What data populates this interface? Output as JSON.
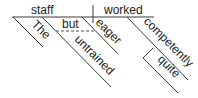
{
  "diagram": {
    "type": "Reed-Kellogg sentence diagram",
    "sentence_words": {
      "subject": "staff",
      "verb": "worked",
      "subject_modifier_article": "The",
      "conjunction": "but",
      "subject_modifier_1": "untrained",
      "subject_modifier_2": "eager",
      "verb_modifier": "competently",
      "adverb_modifier": "quite"
    },
    "colors": {
      "line": "#3a3a3a",
      "text": "#222222",
      "background": "#ffffff"
    }
  }
}
